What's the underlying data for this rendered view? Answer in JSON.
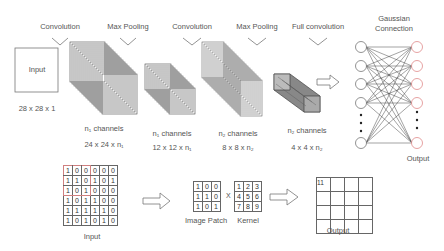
{
  "top_pipeline": {
    "operations": [
      {
        "label": "Convolution",
        "x": 60
      },
      {
        "label": "Max Pooling",
        "x": 128
      },
      {
        "label": "Convolution",
        "x": 192
      },
      {
        "label": "Max Pooling",
        "x": 257
      },
      {
        "label": "Full convolution",
        "x": 318
      }
    ],
    "input": {
      "label": "Input",
      "size": "28 x 28 x 1"
    },
    "layers": [
      {
        "channels": "n₁ channels",
        "size": "24 x 24 x n₁"
      },
      {
        "channels": "n₁ channels",
        "size": "12 x 12 x n₁"
      },
      {
        "channels": "n₂ channels",
        "size": "8 x 8 x n₂"
      },
      {
        "channels": "n₂ channels",
        "size": "4 x 4 x n₂"
      }
    ],
    "network": {
      "title_line1": "Gaussian",
      "title_line2": "Connection",
      "output_label": "Output",
      "output_node_color": "#e08a8a"
    }
  },
  "bottom_example": {
    "input_label": "Input",
    "input_matrix": [
      [
        "1",
        "0",
        "0",
        "0",
        "0",
        "0"
      ],
      [
        "1",
        "1",
        "0",
        "1",
        "0",
        "1"
      ],
      [
        "1",
        "0",
        "1",
        "0",
        "0",
        "0"
      ],
      [
        "1",
        "0",
        "1",
        "1",
        "0",
        "0"
      ],
      [
        "1",
        "1",
        "1",
        "1",
        "1",
        "0"
      ],
      [
        "1",
        "0",
        "1",
        "0",
        "1",
        "0"
      ]
    ],
    "patch_label": "Image Patch",
    "patch_matrix": [
      [
        "1",
        "0",
        "0"
      ],
      [
        "1",
        "1",
        "0"
      ],
      [
        "1",
        "0",
        "1"
      ]
    ],
    "operator": "X",
    "kernel_label": "Kernel",
    "kernel_matrix": [
      [
        "1",
        "2",
        "3"
      ],
      [
        "4",
        "5",
        "6"
      ],
      [
        "7",
        "8",
        "9"
      ]
    ],
    "output_label": "Output",
    "output_first_value": "11",
    "highlight_color": "#d08080"
  }
}
